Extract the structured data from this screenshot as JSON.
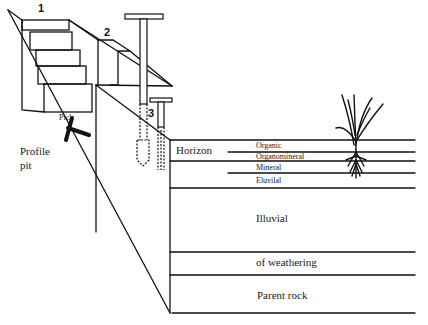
{
  "diagram": {
    "markers": {
      "one": "1",
      "two": "2",
      "three": "3"
    },
    "labels": {
      "pick": "Pick",
      "profile_pit_line1": "Profile",
      "profile_pit_line2": "pit",
      "horizon": "Horizon"
    },
    "horizons": [
      {
        "label": "Organic"
      },
      {
        "label": "Organomineral"
      },
      {
        "label": "Mineral"
      },
      {
        "label": "Eluvilal"
      },
      {
        "label": "Illuvial"
      },
      {
        "label": "of weathering"
      },
      {
        "label": "Parent rock"
      }
    ],
    "colors": {
      "ink": "#111111",
      "background": "#ffffff"
    }
  }
}
